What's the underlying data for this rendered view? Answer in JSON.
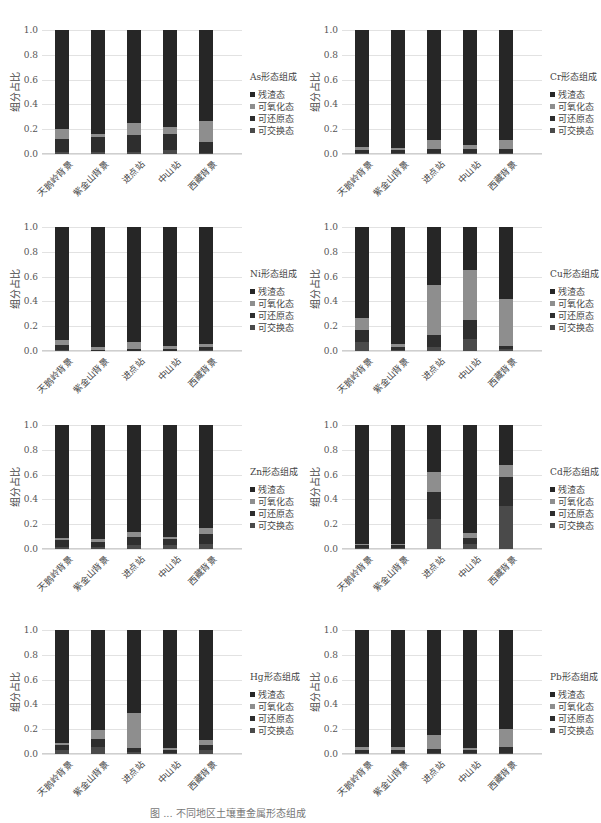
{
  "figure": {
    "categories": [
      "天鹅岭背景",
      "紫金山背景",
      "进点站",
      "中山站",
      "西藏背景"
    ],
    "ylabel": "组分占比",
    "yticks": [
      "1.0",
      "0.8",
      "0.6",
      "0.4",
      "0.2",
      "0.0"
    ],
    "legend_items": [
      "残渣态",
      "可氧化态",
      "可还原态",
      "可交换态"
    ],
    "colors": {
      "可交换态": "#4a4a4a",
      "可还原态": "#2e2e2e",
      "可氧化态": "#8e8e8e",
      "残渣态": "#262626"
    },
    "caption": "图 ... 不同地区土壤重金属形态组成"
  },
  "chart_data": [
    {
      "type": "bar",
      "stacked": true,
      "title": "As形态组成",
      "categories": [
        "天鹅岭背景",
        "紫金山背景",
        "进点站",
        "中山站",
        "西藏背景"
      ],
      "ylabel": "组分占比",
      "ylim": [
        0,
        1.0
      ],
      "series": [
        {
          "name": "可交换态",
          "values": [
            0.02,
            0.02,
            0.02,
            0.03,
            0.01
          ]
        },
        {
          "name": "可还原态",
          "values": [
            0.1,
            0.12,
            0.13,
            0.13,
            0.09
          ]
        },
        {
          "name": "可氧化态",
          "values": [
            0.08,
            0.02,
            0.1,
            0.06,
            0.17
          ]
        },
        {
          "name": "残渣态",
          "values": [
            0.8,
            0.84,
            0.75,
            0.78,
            0.73
          ]
        }
      ]
    },
    {
      "type": "bar",
      "stacked": true,
      "title": "Cr形态组成",
      "categories": [
        "天鹅岭背景",
        "紫金山背景",
        "进点站",
        "中山站",
        "西藏背景"
      ],
      "ylabel": "组分占比",
      "ylim": [
        0,
        1.0
      ],
      "series": [
        {
          "name": "可交换态",
          "values": [
            0.01,
            0.01,
            0.01,
            0.01,
            0.01
          ]
        },
        {
          "name": "可还原态",
          "values": [
            0.02,
            0.02,
            0.03,
            0.03,
            0.03
          ]
        },
        {
          "name": "可氧化态",
          "values": [
            0.03,
            0.02,
            0.07,
            0.03,
            0.07
          ]
        },
        {
          "name": "残渣态",
          "values": [
            0.94,
            0.95,
            0.89,
            0.93,
            0.89
          ]
        }
      ]
    },
    {
      "type": "bar",
      "stacked": true,
      "title": "Ni形态组成",
      "categories": [
        "天鹅岭背景",
        "紫金山背景",
        "进点站",
        "中山站",
        "西藏背景"
      ],
      "ylabel": "组分占比",
      "ylim": [
        0,
        1.0
      ],
      "series": [
        {
          "name": "可交换态",
          "values": [
            0.01,
            0.0,
            0.0,
            0.0,
            0.01
          ]
        },
        {
          "name": "可还原态",
          "values": [
            0.04,
            0.01,
            0.02,
            0.02,
            0.02
          ]
        },
        {
          "name": "可氧化态",
          "values": [
            0.04,
            0.02,
            0.05,
            0.02,
            0.03
          ]
        },
        {
          "name": "残渣态",
          "values": [
            0.91,
            0.97,
            0.93,
            0.96,
            0.94
          ]
        }
      ]
    },
    {
      "type": "bar",
      "stacked": true,
      "title": "Cu形态组成",
      "categories": [
        "天鹅岭背景",
        "紫金山背景",
        "进点站",
        "中山站",
        "西藏背景"
      ],
      "ylabel": "组分占比",
      "ylim": [
        0,
        1.0
      ],
      "series": [
        {
          "name": "可交换态",
          "values": [
            0.07,
            0.01,
            0.03,
            0.1,
            0.02
          ]
        },
        {
          "name": "可还原态",
          "values": [
            0.1,
            0.02,
            0.1,
            0.15,
            0.02
          ]
        },
        {
          "name": "可氧化态",
          "values": [
            0.1,
            0.03,
            0.4,
            0.4,
            0.38
          ]
        },
        {
          "name": "残渣态",
          "values": [
            0.73,
            0.94,
            0.47,
            0.35,
            0.58
          ]
        }
      ]
    },
    {
      "type": "bar",
      "stacked": true,
      "title": "Zn形态组成",
      "categories": [
        "天鹅岭背景",
        "紫金山背景",
        "进点站",
        "中山站",
        "西藏背景"
      ],
      "ylabel": "组分占比",
      "ylim": [
        0,
        1.0
      ],
      "series": [
        {
          "name": "可交换态",
          "values": [
            0.02,
            0.02,
            0.03,
            0.03,
            0.04
          ]
        },
        {
          "name": "可还原态",
          "values": [
            0.05,
            0.04,
            0.07,
            0.05,
            0.08
          ]
        },
        {
          "name": "可氧化态",
          "values": [
            0.02,
            0.02,
            0.04,
            0.02,
            0.05
          ]
        },
        {
          "name": "残渣态",
          "values": [
            0.91,
            0.92,
            0.86,
            0.9,
            0.83
          ]
        }
      ]
    },
    {
      "type": "bar",
      "stacked": true,
      "title": "Cd形态组成",
      "categories": [
        "天鹅岭背景",
        "紫金山背景",
        "进点站",
        "中山站",
        "西藏背景"
      ],
      "ylabel": "组分占比",
      "ylim": [
        0,
        1.0
      ],
      "series": [
        {
          "name": "可交换态",
          "values": [
            0.01,
            0.01,
            0.24,
            0.04,
            0.35
          ]
        },
        {
          "name": "可还原态",
          "values": [
            0.02,
            0.02,
            0.22,
            0.05,
            0.23
          ]
        },
        {
          "name": "可氧化态",
          "values": [
            0.01,
            0.01,
            0.16,
            0.04,
            0.1
          ]
        },
        {
          "name": "残渣态",
          "values": [
            0.96,
            0.96,
            0.38,
            0.87,
            0.32
          ]
        }
      ]
    },
    {
      "type": "bar",
      "stacked": true,
      "title": "Hg形态组成",
      "categories": [
        "天鹅岭背景",
        "紫金山背景",
        "进点站",
        "中山站",
        "西藏背景"
      ],
      "ylabel": "组分占比",
      "ylim": [
        0,
        1.0
      ],
      "series": [
        {
          "name": "可交换态",
          "values": [
            0.03,
            0.06,
            0.02,
            0.01,
            0.03
          ]
        },
        {
          "name": "可还原态",
          "values": [
            0.04,
            0.06,
            0.03,
            0.02,
            0.04
          ]
        },
        {
          "name": "可氧化态",
          "values": [
            0.02,
            0.07,
            0.28,
            0.02,
            0.04
          ]
        },
        {
          "name": "残渣态",
          "values": [
            0.91,
            0.81,
            0.67,
            0.95,
            0.89
          ]
        }
      ]
    },
    {
      "type": "bar",
      "stacked": true,
      "title": "Pb形态组成",
      "categories": [
        "天鹅岭背景",
        "紫金山背景",
        "进点站",
        "中山站",
        "西藏背景"
      ],
      "ylabel": "组分占比",
      "ylim": [
        0,
        1.0
      ],
      "series": [
        {
          "name": "可交换态",
          "values": [
            0.01,
            0.01,
            0.01,
            0.01,
            0.01
          ]
        },
        {
          "name": "可还原态",
          "values": [
            0.02,
            0.02,
            0.03,
            0.02,
            0.05
          ]
        },
        {
          "name": "可氧化态",
          "values": [
            0.03,
            0.03,
            0.11,
            0.02,
            0.14
          ]
        },
        {
          "name": "残渣态",
          "values": [
            0.94,
            0.94,
            0.85,
            0.95,
            0.8
          ]
        }
      ]
    }
  ]
}
